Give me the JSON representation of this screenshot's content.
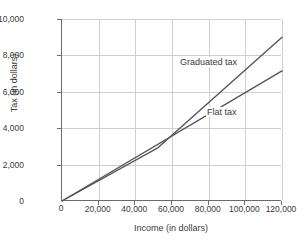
{
  "chart_data": {
    "type": "line",
    "title": "",
    "xlabel": "Income (in dollars)",
    "ylabel": "Tax (in dollars)",
    "xlim": [
      0,
      120000
    ],
    "ylim": [
      0,
      10000
    ],
    "xticks": [
      "0",
      "20,000",
      "40,000",
      "60,000",
      "80,000",
      "100,000",
      "120,000"
    ],
    "xtick_values": [
      0,
      20000,
      40000,
      60000,
      80000,
      100000,
      120000
    ],
    "yticks": [
      "0",
      "2,000",
      "4,000",
      "6,000",
      "8,000",
      "10,000"
    ],
    "ytick_values": [
      0,
      2000,
      4000,
      6000,
      8000,
      10000
    ],
    "grid": true,
    "legend_position": "inline-annotations",
    "series": [
      {
        "name": "Graduated tax",
        "x": [
          0,
          52000,
          120000
        ],
        "values": [
          0,
          2900,
          9000
        ],
        "color": "#555555"
      },
      {
        "name": "Flat tax",
        "x": [
          0,
          120000
        ],
        "values": [
          0,
          7150
        ],
        "color": "#555555"
      }
    ],
    "annotations": [
      {
        "text": "Graduated tax",
        "x": 73000,
        "y": 7900
      },
      {
        "text": "Flat tax",
        "x": 88000,
        "y": 5200
      }
    ],
    "crossing_point": {
      "x": 60000,
      "y": 3600
    }
  },
  "axes": {
    "x_title": "Income (in dollars)",
    "y_title": "Tax (in dollars)"
  }
}
